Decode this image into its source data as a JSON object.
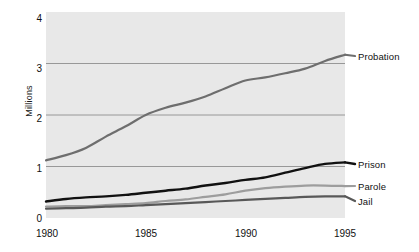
{
  "chart_data": {
    "type": "line",
    "title": "",
    "subtitle": "",
    "xlabel": "",
    "ylabel": "Millions",
    "xlim": [
      1980,
      1995
    ],
    "ylim": [
      0,
      4
    ],
    "grid": "horizontal",
    "gridlines_y": [
      1,
      2,
      3
    ],
    "legend_position": "right-inline",
    "x": [
      1980,
      1981,
      1982,
      1983,
      1984,
      1985,
      1986,
      1987,
      1988,
      1989,
      1990,
      1991,
      1992,
      1993,
      1994,
      1995
    ],
    "xticks": [
      "1980",
      "1985",
      "1990",
      "1995"
    ],
    "xtick_values": [
      1980,
      1985,
      1990,
      1995
    ],
    "yticks": [
      "0",
      "1",
      "2",
      "3",
      "4"
    ],
    "ytick_values": [
      0,
      1,
      2,
      3,
      4
    ],
    "series": [
      {
        "name": "Probation",
        "color": "#6e6e6e",
        "width": 2.2,
        "values": [
          1.12,
          1.22,
          1.36,
          1.58,
          1.78,
          2.0,
          2.14,
          2.24,
          2.36,
          2.52,
          2.67,
          2.73,
          2.81,
          2.9,
          3.05,
          3.17
        ]
      },
      {
        "name": "Prison",
        "color": "#111111",
        "width": 2.4,
        "values": [
          0.32,
          0.37,
          0.4,
          0.42,
          0.45,
          0.49,
          0.53,
          0.57,
          0.63,
          0.68,
          0.74,
          0.79,
          0.88,
          0.97,
          1.05,
          1.08
        ]
      },
      {
        "name": "Parole",
        "color": "#9d9d9d",
        "width": 2.2,
        "values": [
          0.22,
          0.23,
          0.23,
          0.25,
          0.27,
          0.29,
          0.33,
          0.36,
          0.41,
          0.46,
          0.53,
          0.58,
          0.61,
          0.63,
          0.63,
          0.62
        ]
      },
      {
        "name": "Jail",
        "color": "#585858",
        "width": 2.2,
        "values": [
          0.18,
          0.19,
          0.2,
          0.22,
          0.23,
          0.25,
          0.27,
          0.29,
          0.31,
          0.33,
          0.35,
          0.37,
          0.39,
          0.41,
          0.42,
          0.42
        ]
      }
    ],
    "plot_background": "#e8e8e8",
    "gridline_color": "#8f8f8f"
  },
  "axis": {
    "y_title": "Millions",
    "y_ticks": [
      "4",
      "3",
      "2",
      "1",
      "0"
    ],
    "x_ticks": [
      "1980",
      "1985",
      "1990",
      "1995"
    ]
  },
  "labels": {
    "probation": "Probation",
    "prison": "Prison",
    "parole": "Parole",
    "jail": "Jail"
  }
}
